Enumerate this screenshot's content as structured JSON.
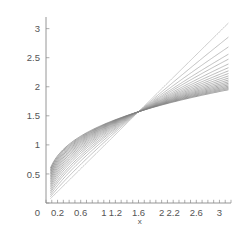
{
  "chart_data": {
    "type": "line",
    "title": "",
    "subtitle": "",
    "xlabel": "x",
    "ylabel": "",
    "grid": false,
    "legend": "none",
    "xlim": [
      0,
      3.2
    ],
    "ylim": [
      0,
      3.2
    ],
    "xticks": [
      0,
      0.2,
      0.6,
      1,
      1.2,
      1.6,
      2,
      2.2,
      2.6,
      3
    ],
    "xticklabels": [
      "0",
      "0.2",
      "0.6",
      "1",
      "1.2",
      "1.6",
      "2",
      "2.2",
      "2.6",
      "3"
    ],
    "yticks": [
      0,
      0.5,
      1,
      1.5,
      2,
      2.5,
      3
    ],
    "yticklabels": [
      "0",
      "0.5",
      "1",
      "1.5",
      "2",
      "2.5",
      "3"
    ],
    "x_minor_tick_step": 0.1,
    "crossing_point": [
      1.6,
      1.57
    ],
    "x_domain": [
      0.08,
      3.15
    ],
    "series_count": 19,
    "series_description": "family of monotonic increasing curves fanning out from a common crossing point",
    "stroke_color": "#808080",
    "series": [
      {
        "name": "curve-1",
        "exponent": 1.0,
        "y_left": 0.08,
        "y_right": 3.15
      },
      {
        "name": "curve-2",
        "exponent": 0.88,
        "y_left": 0.25,
        "y_right": 2.9
      },
      {
        "name": "curve-3",
        "exponent": 0.79,
        "y_left": 0.38,
        "y_right": 2.74
      },
      {
        "name": "curve-4",
        "exponent": 0.72,
        "y_left": 0.47,
        "y_right": 2.66
      },
      {
        "name": "curve-5",
        "exponent": 0.67,
        "y_left": 0.54,
        "y_right": 2.6
      },
      {
        "name": "curve-6",
        "exponent": 0.62,
        "y_left": 0.6,
        "y_right": 2.54
      },
      {
        "name": "curve-7",
        "exponent": 0.58,
        "y_left": 0.65,
        "y_right": 2.49
      },
      {
        "name": "curve-8",
        "exponent": 0.545,
        "y_left": 0.7,
        "y_right": 2.45
      },
      {
        "name": "curve-9",
        "exponent": 0.515,
        "y_left": 0.75,
        "y_right": 2.41
      },
      {
        "name": "curve-10",
        "exponent": 0.487,
        "y_left": 0.79,
        "y_right": 2.37
      },
      {
        "name": "curve-11",
        "exponent": 0.462,
        "y_left": 0.83,
        "y_right": 2.33
      },
      {
        "name": "curve-12",
        "exponent": 0.439,
        "y_left": 0.86,
        "y_right": 2.3
      },
      {
        "name": "curve-13",
        "exponent": 0.418,
        "y_left": 0.89,
        "y_right": 2.27
      },
      {
        "name": "curve-14",
        "exponent": 0.399,
        "y_left": 0.92,
        "y_right": 2.24
      },
      {
        "name": "curve-15",
        "exponent": 0.381,
        "y_left": 0.95,
        "y_right": 2.21
      },
      {
        "name": "curve-16",
        "exponent": 0.364,
        "y_left": 0.97,
        "y_right": 2.18
      },
      {
        "name": "curve-17",
        "exponent": 0.348,
        "y_left": 1.0,
        "y_right": 2.15
      },
      {
        "name": "curve-18",
        "exponent": 0.333,
        "y_left": 1.02,
        "y_right": 2.12
      },
      {
        "name": "curve-19",
        "exponent": 0.318,
        "y_left": 1.05,
        "y_right": 2.08
      }
    ]
  }
}
